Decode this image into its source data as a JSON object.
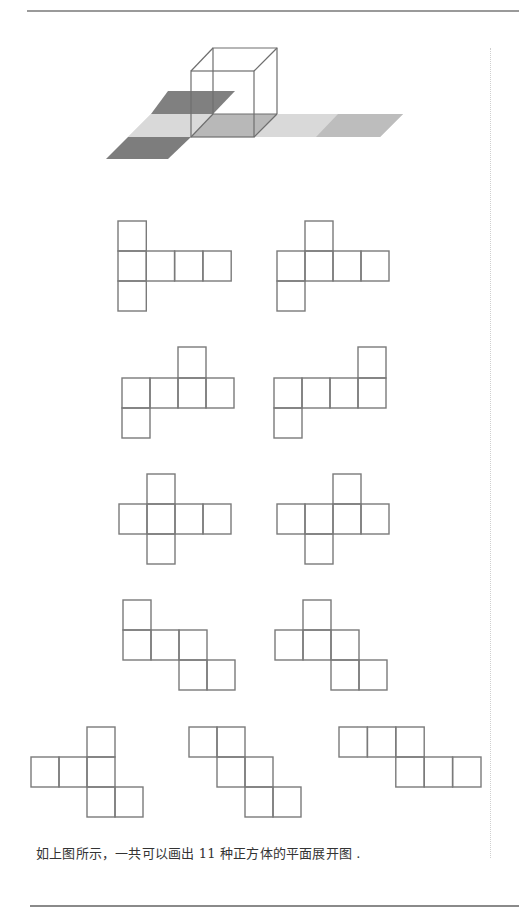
{
  "caption": "如上图所示，一共可以画出 11 种正方体的平面展开图 .",
  "figure": {
    "net_count": 11,
    "colors": {
      "line": "#7a7a7a",
      "dark_face": "#7d7d7d",
      "mid_face": "#b5b5b5",
      "light_face": "#d9d9d9"
    }
  },
  "nets": [
    {
      "id": 1,
      "cells": [
        [
          0,
          0
        ],
        [
          0,
          1
        ],
        [
          1,
          1
        ],
        [
          2,
          1
        ],
        [
          3,
          1
        ],
        [
          0,
          2
        ]
      ]
    },
    {
      "id": 2,
      "cells": [
        [
          1,
          0
        ],
        [
          0,
          1
        ],
        [
          1,
          1
        ],
        [
          2,
          1
        ],
        [
          3,
          1
        ],
        [
          0,
          2
        ]
      ]
    },
    {
      "id": 3,
      "cells": [
        [
          2,
          0
        ],
        [
          0,
          1
        ],
        [
          1,
          1
        ],
        [
          2,
          1
        ],
        [
          3,
          1
        ],
        [
          0,
          2
        ]
      ]
    },
    {
      "id": 4,
      "cells": [
        [
          3,
          0
        ],
        [
          0,
          1
        ],
        [
          1,
          1
        ],
        [
          2,
          1
        ],
        [
          3,
          1
        ],
        [
          0,
          2
        ]
      ]
    },
    {
      "id": 5,
      "cells": [
        [
          1,
          0
        ],
        [
          0,
          1
        ],
        [
          1,
          1
        ],
        [
          2,
          1
        ],
        [
          3,
          1
        ],
        [
          1,
          2
        ]
      ]
    },
    {
      "id": 6,
      "cells": [
        [
          2,
          0
        ],
        [
          0,
          1
        ],
        [
          1,
          1
        ],
        [
          2,
          1
        ],
        [
          3,
          1
        ],
        [
          1,
          2
        ]
      ]
    },
    {
      "id": 7,
      "cells": [
        [
          0,
          0
        ],
        [
          0,
          1
        ],
        [
          1,
          1
        ],
        [
          2,
          1
        ],
        [
          2,
          2
        ],
        [
          3,
          2
        ]
      ]
    },
    {
      "id": 8,
      "cells": [
        [
          1,
          0
        ],
        [
          0,
          1
        ],
        [
          1,
          1
        ],
        [
          2,
          1
        ],
        [
          2,
          2
        ],
        [
          3,
          2
        ]
      ]
    },
    {
      "id": 9,
      "cells": [
        [
          2,
          0
        ],
        [
          0,
          1
        ],
        [
          1,
          1
        ],
        [
          2,
          1
        ],
        [
          2,
          2
        ],
        [
          3,
          2
        ]
      ]
    },
    {
      "id": 10,
      "cells": [
        [
          0,
          0
        ],
        [
          1,
          0
        ],
        [
          1,
          1
        ],
        [
          2,
          1
        ],
        [
          2,
          2
        ],
        [
          3,
          2
        ]
      ]
    },
    {
      "id": 11,
      "cells": [
        [
          0,
          0
        ],
        [
          1,
          0
        ],
        [
          2,
          0
        ],
        [
          2,
          1
        ],
        [
          3,
          1
        ],
        [
          4,
          1
        ]
      ]
    }
  ]
}
